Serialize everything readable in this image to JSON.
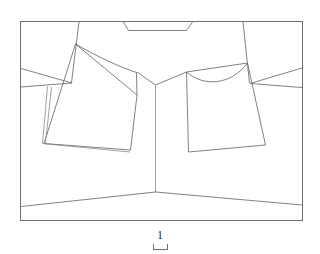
{
  "figure": {
    "label": "1",
    "title": "",
    "caption_position": "below",
    "background_color": "#ffffff",
    "line_color": "#6b6b6b",
    "frame_color": "#707070",
    "scale_bar": {
      "present": true,
      "shape": "open-top-rectangle-bracket",
      "width_px": 15
    }
  },
  "drawing": {
    "type": "technical-line-drawing",
    "subject": "garment-front-flat-view",
    "frame": {
      "x": 20,
      "y": 21,
      "width": 283,
      "height": 200
    },
    "parts": [
      {
        "name": "collar-band",
        "description": "trapezoidal collar at top center"
      },
      {
        "name": "left-shoulder-yoke",
        "description": "upper left panel bounded by curved hem"
      },
      {
        "name": "right-shoulder-yoke",
        "description": "upper right panel bounded by concave curve"
      },
      {
        "name": "left-front-panel",
        "description": "tilted quadrilateral left body panel"
      },
      {
        "name": "right-front-panel",
        "description": "tilted quadrilateral right body panel"
      },
      {
        "name": "left-placket-strip",
        "description": "narrow double-line strip along left panel edge"
      },
      {
        "name": "center-front-seam",
        "description": "vertical center line from neck V to hem"
      },
      {
        "name": "center-v-notch",
        "description": "V shaped neckline opening at center"
      },
      {
        "name": "bottom-hem",
        "description": "shallow inverted-V hem line across lower area"
      },
      {
        "name": "left-side-seam",
        "description": "diagonal seam at left side"
      },
      {
        "name": "right-side-seam",
        "description": "diagonal seam at right side"
      }
    ]
  }
}
